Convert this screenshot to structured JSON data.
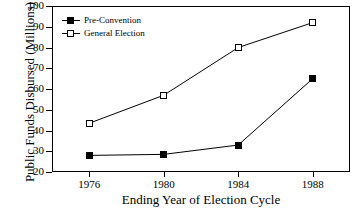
{
  "chart_data": {
    "type": "line",
    "title": "",
    "xlabel": "Ending Year of Election Cycle",
    "ylabel": "Public Funds Disbursed (Millions)",
    "categories": [
      "1976",
      "1980",
      "1984",
      "1988"
    ],
    "x": [
      1976,
      1980,
      1984,
      1988
    ],
    "xlim": [
      1974,
      1990
    ],
    "ylim": [
      20,
      100
    ],
    "ytick_labels": [
      "20",
      "30",
      "40",
      "50",
      "60",
      "70",
      "80",
      "90",
      "100"
    ],
    "yticks": [
      20,
      30,
      40,
      50,
      60,
      70,
      80,
      90,
      100
    ],
    "grid": false,
    "legend_position": "upper-left-inside",
    "series": [
      {
        "name": "Pre-Convention",
        "marker": "filled-square",
        "color": "#000000",
        "values": [
          28,
          28.5,
          33,
          65
        ]
      },
      {
        "name": "General Election",
        "marker": "open-square",
        "color": "#000000",
        "values": [
          43.5,
          57,
          80,
          92
        ]
      }
    ]
  },
  "legend": {
    "items": [
      {
        "label": "Pre-Convention",
        "marker": "filled-square"
      },
      {
        "label": "General Election",
        "marker": "open-square"
      }
    ]
  },
  "axes": {
    "y_title": "Public Funds Disbursed (Millions)",
    "x_title": "Ending Year of Election Cycle"
  }
}
